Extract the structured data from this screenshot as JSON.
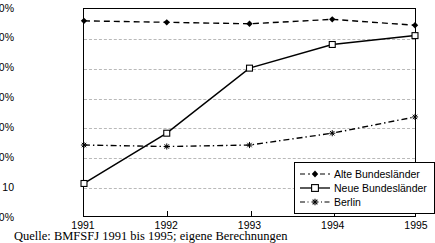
{
  "chart_data": {
    "type": "line",
    "title": "",
    "subtitle": "",
    "xlabel": "",
    "ylabel": "",
    "categories": [
      "1991",
      "1992",
      "1993",
      "1994",
      "1995"
    ],
    "x": [
      1991,
      1992,
      1993,
      1994,
      1995
    ],
    "ylim": [
      0,
      70
    ],
    "ytick_values": [
      0,
      10,
      20,
      30,
      40,
      50,
      60,
      70
    ],
    "ytick_labels": [
      "0%",
      "10",
      "20%",
      "30%",
      "40%",
      "50%",
      "60%",
      "70%"
    ],
    "grid": true,
    "grid_axis": "y",
    "legend_position": "bottom-right",
    "series": [
      {
        "name": "Alte Bundesländer",
        "values": [
          66.0,
          65.5,
          65.0,
          66.5,
          64.5
        ],
        "line_style": "dashed",
        "marker": "filled-diamond",
        "color": "#000000"
      },
      {
        "name": "Neue Bundesländer",
        "values": [
          11.0,
          28.0,
          50.0,
          58.0,
          61.0
        ],
        "line_style": "solid",
        "marker": "open-square",
        "color": "#000000"
      },
      {
        "name": "Berlin",
        "values": [
          24.0,
          23.5,
          24.0,
          28.0,
          33.5
        ],
        "line_style": "dash-dot",
        "marker": "star",
        "color": "#000000"
      }
    ]
  },
  "legend": {
    "items": [
      {
        "label": "Alte Bundesländer"
      },
      {
        "label": "Neue Bundesländer"
      },
      {
        "label": "Berlin"
      }
    ]
  },
  "caption": {
    "text": "Quelle: BMFSFJ 1991 bis 1995; eigene Berechnungen"
  },
  "colors": {
    "ink": "#000000",
    "grid": "#b9b9b9",
    "background": "#ffffff"
  }
}
